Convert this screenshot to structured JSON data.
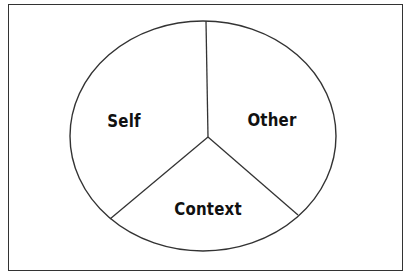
{
  "diagram": {
    "type": "circle-divided-into-three-segments",
    "frame": {
      "stroke": "#333333"
    },
    "ellipse": {
      "cx": 203,
      "cy": 136,
      "rx": 133,
      "ry": 115,
      "stroke": "#333333",
      "fill": "#ffffff"
    },
    "center": {
      "x": 208,
      "y": 137
    },
    "dividers": [
      {
        "name": "divider-top",
        "x1": 208,
        "y1": 137,
        "x2": 206,
        "y2": 21
      },
      {
        "name": "divider-lower-left",
        "x1": 208,
        "y1": 137,
        "x2": 110,
        "y2": 219
      },
      {
        "name": "divider-lower-right",
        "x1": 208,
        "y1": 137,
        "x2": 298,
        "y2": 215
      }
    ],
    "segments": [
      {
        "name": "segment-self",
        "label": "Self",
        "x": 124,
        "y": 121
      },
      {
        "name": "segment-other",
        "label": "Other",
        "x": 272,
        "y": 120
      },
      {
        "name": "segment-context",
        "label": "Context",
        "x": 208,
        "y": 209
      }
    ]
  }
}
